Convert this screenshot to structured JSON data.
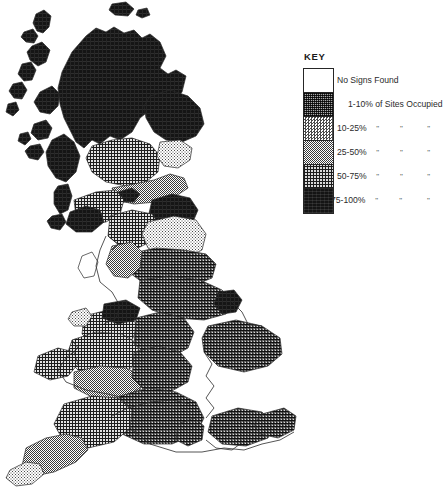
{
  "figure": {
    "background_color": "#ffffff",
    "outline_color": "#262626"
  },
  "legend": {
    "title": "KEY",
    "classes": [
      {
        "swatch": "no-signs",
        "range": "No Signs Found",
        "suffix": "",
        "dittos": [],
        "fill_hint": "white",
        "color": "#ffffff",
        "indent": false
      },
      {
        "swatch": "stipple-coarse",
        "range": "1-10% of Sites Occupied",
        "suffix": "",
        "dittos": [],
        "fill_hint": "coarse-dark-stipple",
        "color": "#6f6f6f",
        "indent": true
      },
      {
        "swatch": "dots-fine",
        "range": "10-25%",
        "suffix": "of Sites Occupied",
        "dittos": [
          "\"",
          "\"",
          "\""
        ],
        "fill_hint": "fine-light-checker",
        "color": "#cfcfcf",
        "indent": false
      },
      {
        "swatch": "checker-medium",
        "range": "25-50%",
        "suffix": "of Sites Occupied",
        "dittos": [
          "\"",
          "\"",
          "\""
        ],
        "fill_hint": "medium-checker",
        "color": "#9a9a9a",
        "indent": false
      },
      {
        "swatch": "crosshatch",
        "range": "50-75%",
        "suffix": "of Sites Occupied",
        "dittos": [
          "\"",
          "\"",
          "\""
        ],
        "fill_hint": "dense-crosshatch-grid",
        "color": "#5a5a5a",
        "indent": false
      },
      {
        "swatch": "solid-black",
        "range": "75-100%",
        "suffix": "of Sites Occupied",
        "dittos": [
          "\"",
          "\"",
          "\""
        ],
        "fill_hint": "solid-black",
        "color": "#141414",
        "indent": false
      }
    ]
  },
  "map": {
    "title": "",
    "subject": "United Kingdom and Ireland (part) distribution map",
    "regions": [
      {
        "name": "orkney-shetland-isles",
        "class": "75-100%"
      },
      {
        "name": "outer-hebrides",
        "class": "75-100%"
      },
      {
        "name": "isle-of-skye",
        "class": "75-100%"
      },
      {
        "name": "northwest-highlands",
        "class": "75-100%"
      },
      {
        "name": "grampian-northeast-scotland",
        "class": "75-100%"
      },
      {
        "name": "central-scotland-lowlands",
        "class": "50-75%"
      },
      {
        "name": "fife-lothian",
        "class": "10-25%"
      },
      {
        "name": "argyll-inner-hebrides",
        "class": "75-100%"
      },
      {
        "name": "scottish-borders",
        "class": "25-50%"
      },
      {
        "name": "dumfries-galloway",
        "class": "50-75%"
      },
      {
        "name": "northumberland",
        "class": "75-100%"
      },
      {
        "name": "cumbria-lake-district",
        "class": "50-75%"
      },
      {
        "name": "yorkshire-dales",
        "class": "10-25%"
      },
      {
        "name": "north-yorkshire-moors",
        "class": "1-10%"
      },
      {
        "name": "lancashire",
        "class": "25-50%"
      },
      {
        "name": "isle-of-man",
        "class": "No Signs Found"
      },
      {
        "name": "east-midlands",
        "class": "1-10%"
      },
      {
        "name": "lincolnshire-coast",
        "class": "75-100%"
      },
      {
        "name": "north-wales",
        "class": "50-75%"
      },
      {
        "name": "mid-wales",
        "class": "50-75%"
      },
      {
        "name": "pembrokeshire-west-wales",
        "class": "50-75%"
      },
      {
        "name": "south-wales",
        "class": "25-50%"
      },
      {
        "name": "welsh-marches-midlands",
        "class": "1-10%"
      },
      {
        "name": "severn-cotswolds",
        "class": "1-10%"
      },
      {
        "name": "somerset-wessex",
        "class": "1-10%"
      },
      {
        "name": "devon",
        "class": "50-75%"
      },
      {
        "name": "cornwall",
        "class": "25-50%"
      },
      {
        "name": "east-anglia",
        "class": "1-10%"
      },
      {
        "name": "thames-home-counties",
        "class": "1-10%"
      },
      {
        "name": "kent-south-coast",
        "class": "1-10%"
      },
      {
        "name": "isle-of-wight",
        "class": "1-10%"
      },
      {
        "name": "southern-england-coast",
        "class": "No Signs Found"
      },
      {
        "name": "east-coast-england",
        "class": "No Signs Found"
      }
    ]
  }
}
